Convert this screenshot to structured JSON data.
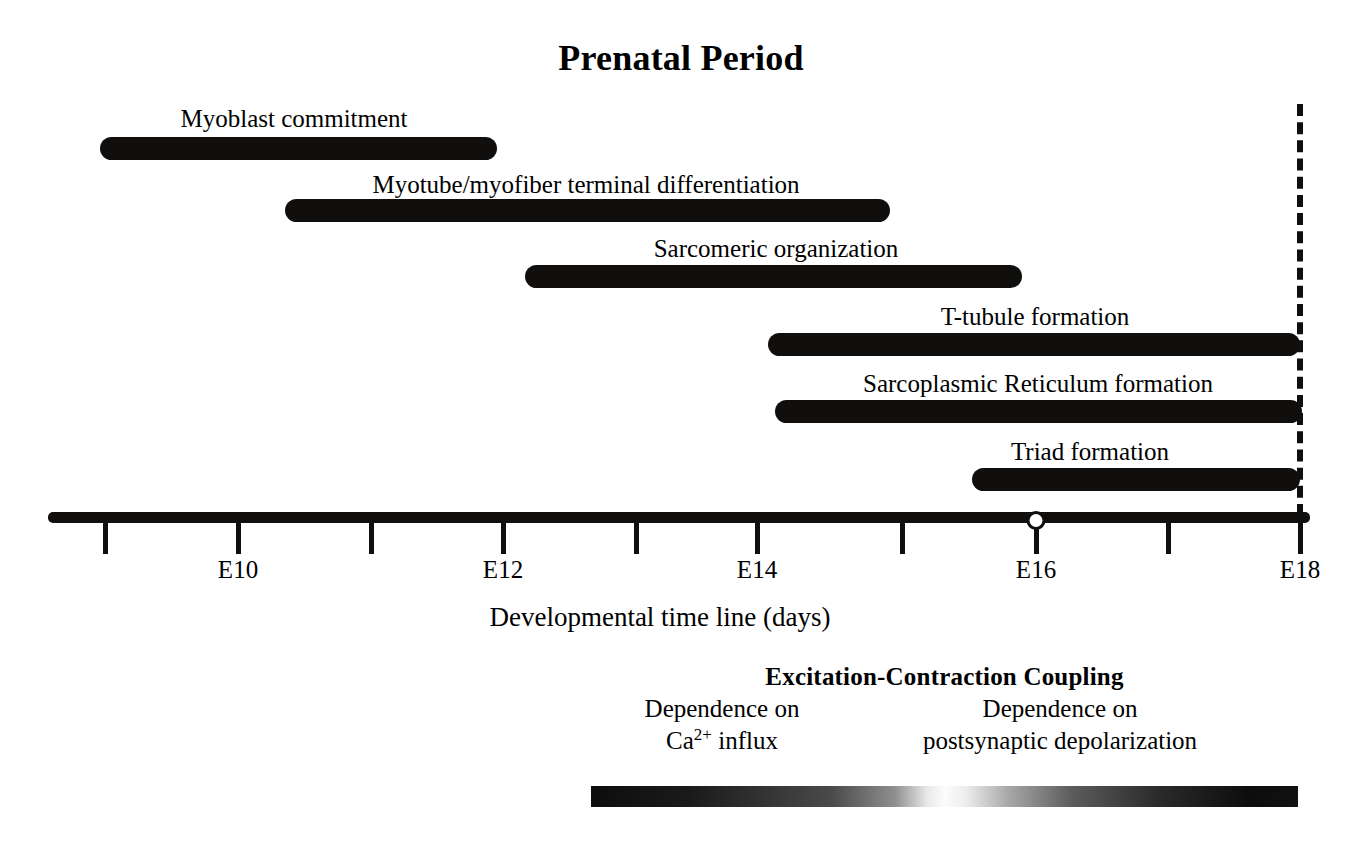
{
  "figure": {
    "title": "Prenatal Period",
    "axis_caption": "Developmental time line (days)"
  },
  "chart_data": {
    "type": "bar",
    "title": "Prenatal Period",
    "xlabel": "Developmental time line (days)",
    "ylabel": "",
    "xlim": [
      8.4,
      18.5
    ],
    "grid": false,
    "legend": "none",
    "orientation": "horizontal-gantt",
    "tick_days": [
      9,
      10,
      11,
      12,
      13,
      14,
      15,
      16,
      17,
      18
    ],
    "tick_labels": [
      "",
      "E10",
      "",
      "E12",
      "",
      "E14",
      "",
      "E16",
      "",
      "E18"
    ],
    "axis_marker_day": 16,
    "term_line_day": 18,
    "categories": [
      "Myoblast commitment",
      "Myotube/myofiber terminal differentiation",
      "Sarcomeric organization",
      "T-tubule formation",
      "Sarcoplasmic Reticulum formation",
      "Triad formation"
    ],
    "spans": [
      {
        "label": "Myoblast commitment",
        "start": 8.96,
        "end": 11.95
      },
      {
        "label": "Myotube/myofiber terminal differentiation",
        "start": 10.35,
        "end": 14.91
      },
      {
        "label": "Sarcomeric organization",
        "start": 12.16,
        "end": 15.9
      },
      {
        "label": "T-tubule formation",
        "start": 13.99,
        "end": 18.0
      },
      {
        "label": "Sarcoplasmic Reticulum formation",
        "start": 14.05,
        "end": 18.0
      },
      {
        "label": "Triad formation",
        "start": 15.53,
        "end": 18.0
      }
    ]
  },
  "rows": [
    {
      "label": "Myoblast commitment",
      "label_center_x": 294,
      "label_top": 104,
      "bar_left": 100,
      "bar_width": 397,
      "bar_top": 137
    },
    {
      "label": "Myotube/myofiber terminal differentiation",
      "label_center_x": 586,
      "label_top": 170,
      "bar_left": 285,
      "bar_width": 605,
      "bar_top": 199
    },
    {
      "label": "Sarcomeric organization",
      "label_center_x": 776,
      "label_top": 234,
      "bar_left": 525,
      "bar_width": 497,
      "bar_top": 265
    },
    {
      "label": "T-tubule formation",
      "label_center_x": 1035,
      "label_top": 302,
      "bar_left": 768,
      "bar_width": 532,
      "bar_top": 333
    },
    {
      "label": "Sarcoplasmic Reticulum formation",
      "label_center_x": 1038,
      "label_top": 369,
      "bar_left": 775,
      "bar_width": 527,
      "bar_top": 400
    },
    {
      "label": "Triad formation",
      "label_center_x": 1090,
      "label_top": 437,
      "bar_left": 972,
      "bar_width": 328,
      "bar_top": 468
    }
  ],
  "axis": {
    "line_left": 48,
    "line_width": 1262,
    "marker_x": 1036,
    "ticks": [
      {
        "x": 105,
        "label": ""
      },
      {
        "x": 238,
        "label": "E10"
      },
      {
        "x": 371,
        "label": ""
      },
      {
        "x": 503,
        "label": "E12"
      },
      {
        "x": 636,
        "label": ""
      },
      {
        "x": 757,
        "label": "E14"
      },
      {
        "x": 902,
        "label": ""
      },
      {
        "x": 1036,
        "label": "E16"
      },
      {
        "x": 1168,
        "label": ""
      },
      {
        "x": 1300,
        "label": "E18"
      }
    ],
    "term_line_x": 1297
  },
  "excitation_contraction": {
    "title": "Excitation-Contraction Coupling",
    "left_label_line1": "Dependence on",
    "left_label_line2_prefix": "Ca",
    "left_label_line2_sup": "2+",
    "left_label_line2_suffix": " influx",
    "left_label_center_x": 722,
    "right_label_line1": "Dependence on",
    "right_label_line2": "postsynaptic depolarization",
    "right_label_center_x": 1060,
    "gradient_left_color": "#0d0d0d",
    "gradient_mid_color": "#fcfcfc",
    "gradient_right_color": "#111111"
  }
}
